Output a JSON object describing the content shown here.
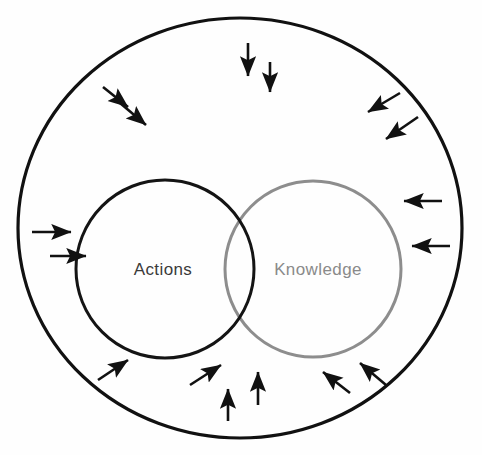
{
  "diagram": {
    "type": "venn-with-inward-arrows",
    "title": "",
    "background_color": "#fefefe",
    "outer_boundary": {
      "name": "environment-boundary",
      "shape": "circle",
      "cx": 240,
      "cy": 228,
      "rx": 222,
      "ry": 210,
      "stroke": "#111111",
      "stroke_width": 3.2,
      "fill": "none",
      "label": ""
    },
    "sets": [
      {
        "id": "actions",
        "label": "Actions",
        "cx": 165,
        "cy": 269,
        "r": 89,
        "stroke": "#141414",
        "stroke_width": 3.0,
        "label_color": "#3a3a3a",
        "label_x": 163,
        "label_y": 275,
        "fill": "none"
      },
      {
        "id": "knowledge",
        "label": "Knowledge",
        "cx": 313,
        "cy": 269,
        "r": 88,
        "stroke": "#8d8d8d",
        "stroke_width": 3.0,
        "label_color": "#8a8a8a",
        "label_x": 318,
        "label_y": 275,
        "fill": "none"
      }
    ],
    "arrows": {
      "color": "#111111",
      "stroke_width": 2.6,
      "head_length": 9,
      "head_width": 7,
      "count": 14,
      "description": "inward-pointing arrows distributed around the outer boundary",
      "items": [
        {
          "id": "arrow-top-1",
          "x1": 248,
          "y1": 43,
          "x2": 248,
          "y2": 76,
          "direction": "down"
        },
        {
          "id": "arrow-top-2",
          "x1": 270,
          "y1": 62,
          "x2": 270,
          "y2": 92,
          "direction": "down"
        },
        {
          "id": "arrow-upper-left-1",
          "x1": 103,
          "y1": 87,
          "x2": 128,
          "y2": 107,
          "direction": "down-right"
        },
        {
          "id": "arrow-upper-left-2",
          "x1": 120,
          "y1": 103,
          "x2": 146,
          "y2": 125,
          "direction": "down-right"
        },
        {
          "id": "arrow-upper-right-1",
          "x1": 400,
          "y1": 93,
          "x2": 368,
          "y2": 112,
          "direction": "down-left"
        },
        {
          "id": "arrow-upper-right-2",
          "x1": 418,
          "y1": 117,
          "x2": 386,
          "y2": 139,
          "direction": "down-left"
        },
        {
          "id": "arrow-right-1",
          "x1": 442,
          "y1": 201,
          "x2": 404,
          "y2": 201,
          "direction": "left"
        },
        {
          "id": "arrow-right-2",
          "x1": 450,
          "y1": 246,
          "x2": 412,
          "y2": 246,
          "direction": "left"
        },
        {
          "id": "arrow-left-1",
          "x1": 32,
          "y1": 232,
          "x2": 71,
          "y2": 232,
          "direction": "right"
        },
        {
          "id": "arrow-left-2",
          "x1": 50,
          "y1": 256,
          "x2": 86,
          "y2": 256,
          "direction": "right"
        },
        {
          "id": "arrow-lower-left-1",
          "x1": 98,
          "y1": 380,
          "x2": 128,
          "y2": 360,
          "direction": "up-right"
        },
        {
          "id": "arrow-lower-left-2",
          "x1": 190,
          "y1": 385,
          "x2": 221,
          "y2": 365,
          "direction": "up-right"
        },
        {
          "id": "arrow-bottom-1",
          "x1": 228,
          "y1": 421,
          "x2": 228,
          "y2": 389,
          "direction": "up"
        },
        {
          "id": "arrow-bottom-2",
          "x1": 258,
          "y1": 405,
          "x2": 258,
          "y2": 372,
          "direction": "up"
        },
        {
          "id": "arrow-lower-right-1",
          "x1": 350,
          "y1": 393,
          "x2": 323,
          "y2": 372,
          "direction": "up-left"
        },
        {
          "id": "arrow-lower-right-2",
          "x1": 386,
          "y1": 385,
          "x2": 360,
          "y2": 363,
          "direction": "up-left"
        }
      ]
    }
  }
}
